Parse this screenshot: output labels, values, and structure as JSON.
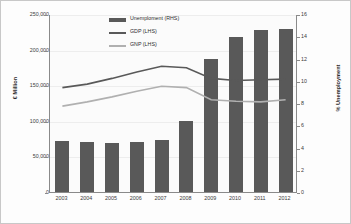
{
  "chart_data": {
    "type": "bar",
    "title": "",
    "categories": [
      "2003",
      "2004",
      "2005",
      "2006",
      "2007",
      "2008",
      "2009",
      "2010",
      "2011",
      "2012"
    ],
    "xlabel": "",
    "ylabel": "€ Million",
    "y2label": "% Unemployment",
    "ylim": [
      0,
      250000
    ],
    "y2lim": [
      0,
      16
    ],
    "grid": true,
    "legend_position": "top-center",
    "series": [
      {
        "name": "Unemploment (RHS)",
        "type": "bar",
        "axis": "right",
        "color": "#595959",
        "values": [
          4.6,
          4.5,
          4.4,
          4.5,
          4.7,
          6.4,
          12.0,
          13.9,
          14.6,
          14.7
        ]
      },
      {
        "name": "GDP (LHS)",
        "type": "line",
        "axis": "left",
        "color": "#595959",
        "values": [
          148000,
          153000,
          161000,
          170000,
          178000,
          176000,
          161000,
          158000,
          159000,
          160000
        ]
      },
      {
        "name": "GNP (LHS)",
        "type": "line",
        "axis": "left",
        "color": "#b0b0b0",
        "values": [
          122000,
          128000,
          135000,
          143000,
          150000,
          148000,
          131000,
          129000,
          128000,
          131000
        ]
      }
    ],
    "y_ticks_left": [
      "250,000",
      "200,000",
      "150,000",
      "100,000",
      "50,000",
      "0"
    ],
    "y_ticks_left_values": [
      250000,
      200000,
      150000,
      100000,
      50000,
      0
    ],
    "y_ticks_right": [
      "16",
      "14",
      "12",
      "10",
      "8",
      "6",
      "4",
      "2",
      "0"
    ],
    "y_ticks_right_values": [
      16,
      14,
      12,
      10,
      8,
      6,
      4,
      2,
      0
    ]
  },
  "legend": {
    "items": [
      {
        "label": "Unemploment (RHS)",
        "marker": "bar",
        "color": "#595959"
      },
      {
        "label": "GDP (LHS)",
        "marker": "line",
        "color": "#595959"
      },
      {
        "label": "GNP (LHS)",
        "marker": "line",
        "color": "#b0b0b0"
      }
    ]
  }
}
